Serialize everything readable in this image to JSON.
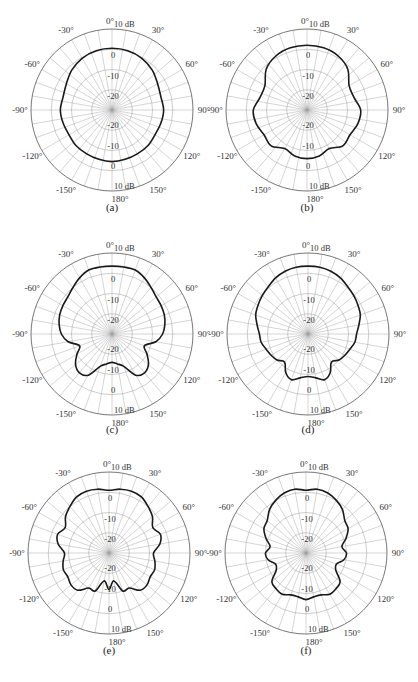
{
  "chart_data": [
    {
      "type": "polar",
      "caption": "(a)",
      "radial_unit": "dB",
      "rlim": [
        -30,
        10
      ],
      "ring_labels_top": [
        "0",
        "-10",
        "-20"
      ],
      "ring_labels_bottom": [
        "-20",
        "-10",
        "0"
      ],
      "outer_label": "10 dB",
      "angle_labels": [
        "0°",
        "30°",
        "60°",
        "90°",
        "120°",
        "150°",
        "180°",
        "-150°",
        "-120°",
        "-90°",
        "-60°",
        "-30°"
      ],
      "theta_deg": [
        0,
        15,
        30,
        45,
        60,
        75,
        90,
        105,
        120,
        135,
        150,
        165,
        180,
        195,
        210,
        225,
        240,
        255,
        270,
        285,
        300,
        315,
        330,
        345
      ],
      "r_db": [
        0.5,
        0.3,
        -0.5,
        -2,
        -4,
        -5,
        -4.5,
        -5,
        -5.5,
        -5,
        -5,
        -4.8,
        -4.5,
        -4.8,
        -5,
        -5,
        -5.5,
        -5,
        -4.5,
        -5,
        -4,
        -2,
        -0.5,
        0.3
      ]
    },
    {
      "type": "polar",
      "caption": "(b)",
      "radial_unit": "dB",
      "rlim": [
        -30,
        10
      ],
      "ring_labels_top": [
        "0",
        "-10",
        "-20"
      ],
      "ring_labels_bottom": [
        "-20",
        "-10",
        "0"
      ],
      "outer_label": "10 dB",
      "angle_labels": [
        "0°",
        "30°",
        "60°",
        "90°",
        "120°",
        "150°",
        "180°",
        "-150°",
        "-120°",
        "-90°",
        "-60°",
        "-30°"
      ],
      "theta_deg": [
        0,
        15,
        30,
        45,
        60,
        75,
        90,
        105,
        120,
        135,
        150,
        165,
        180,
        195,
        210,
        225,
        240,
        255,
        270,
        285,
        300,
        315,
        330,
        345
      ],
      "r_db": [
        2,
        1.8,
        0.8,
        -1.5,
        -6,
        -6,
        -3.5,
        -4,
        -5.5,
        -5,
        -8,
        -6.5,
        -6,
        -6.5,
        -8,
        -5,
        -5.5,
        -4,
        -3.5,
        -6,
        -6,
        -1.5,
        0.8,
        1.8
      ]
    },
    {
      "type": "polar",
      "caption": "(c)",
      "radial_unit": "dB",
      "rlim": [
        -30,
        10
      ],
      "ring_labels_top": [
        "0",
        "-10",
        "-20"
      ],
      "ring_labels_bottom": [
        "-20",
        "-10",
        "0"
      ],
      "outer_label": "10 dB",
      "angle_labels": [
        "0°",
        "30°",
        "60°",
        "90°",
        "120°",
        "150°",
        "180°",
        "-150°",
        "-120°",
        "-90°",
        "-60°",
        "-30°"
      ],
      "theta_deg": [
        0,
        10,
        20,
        30,
        40,
        50,
        60,
        70,
        80,
        90,
        100,
        110,
        120,
        130,
        140,
        150,
        160,
        170,
        180,
        190,
        200,
        210,
        220,
        230,
        240,
        250,
        260,
        270,
        280,
        290,
        300,
        310,
        320,
        330,
        340,
        350
      ],
      "r_db": [
        3.5,
        3.6,
        3.6,
        2,
        0,
        -1.5,
        -2,
        -2.5,
        -3.5,
        -5,
        -8,
        -13,
        -10,
        -6.5,
        -5,
        -6.5,
        -13,
        -15,
        -16,
        -15,
        -13,
        -6.5,
        -5,
        -6.5,
        -10,
        -13,
        -8,
        -5,
        -3.5,
        -2.5,
        -2,
        -1.5,
        0,
        2,
        3.6,
        3.6
      ]
    },
    {
      "type": "polar",
      "caption": "(d)",
      "radial_unit": "dB",
      "rlim": [
        -30,
        10
      ],
      "ring_labels_top": [
        "0",
        "-10",
        "-20"
      ],
      "ring_labels_bottom": [
        "-20",
        "-10",
        "0"
      ],
      "outer_label": "10 dB",
      "angle_labels": [
        "0°",
        "30°",
        "60°",
        "90°",
        "120°",
        "150°",
        "180°",
        "-150°",
        "-120°",
        "-90°",
        "-60°",
        "-30°"
      ],
      "theta_deg": [
        0,
        10,
        20,
        30,
        40,
        50,
        60,
        70,
        80,
        90,
        100,
        110,
        120,
        130,
        140,
        150,
        160,
        170,
        180,
        190,
        200,
        210,
        220,
        230,
        240,
        250,
        260,
        270,
        280,
        290,
        300,
        310,
        320,
        330,
        340,
        350
      ],
      "r_db": [
        3.5,
        3.5,
        3,
        2,
        0.5,
        -0.5,
        -1.5,
        -2.5,
        -4.5,
        -6,
        -6.5,
        -8,
        -9,
        -10,
        -12,
        -8,
        -6,
        -8,
        -9,
        -8,
        -6,
        -8,
        -12,
        -10,
        -9,
        -8,
        -6.5,
        -6,
        -4.5,
        -2.5,
        -1.5,
        -0.5,
        0.5,
        2,
        3,
        3.5
      ]
    },
    {
      "type": "polar",
      "caption": "(e)",
      "radial_unit": "dB",
      "rlim": [
        -30,
        10
      ],
      "ring_labels_top": [
        "0",
        "-10",
        "-20"
      ],
      "ring_labels_bottom": [
        "-20",
        "-10",
        "0"
      ],
      "outer_label": "10 dB",
      "angle_labels": [
        "0°",
        "30°",
        "60°",
        "90°",
        "120°",
        "150°",
        "180°",
        "-150°",
        "-120°",
        "-90°",
        "-60°",
        "-30°"
      ],
      "theta_deg": [
        0,
        10,
        20,
        30,
        40,
        50,
        60,
        70,
        80,
        90,
        100,
        110,
        120,
        130,
        140,
        150,
        160,
        170,
        180,
        190,
        200,
        210,
        220,
        230,
        240,
        250,
        260,
        270,
        280,
        290,
        300,
        310,
        320,
        330,
        340,
        350
      ],
      "r_db": [
        1,
        2,
        2.5,
        2,
        0,
        -2,
        -5,
        -3,
        -4.5,
        -8,
        -7,
        -6,
        -6.5,
        -5.5,
        -6,
        -10,
        -10,
        -16,
        -12,
        -16,
        -10,
        -10,
        -6,
        -5.5,
        -6.5,
        -6,
        -7,
        -8,
        -4.5,
        -3,
        -5,
        -2,
        0,
        2,
        2.5,
        2
      ]
    },
    {
      "type": "polar",
      "caption": "(f)",
      "radial_unit": "dB",
      "rlim": [
        -30,
        10
      ],
      "ring_labels_top": [
        "0",
        "-10",
        "-20"
      ],
      "ring_labels_bottom": [
        "-20",
        "-10",
        "0"
      ],
      "outer_label": "10 dB",
      "angle_labels": [
        "0°",
        "30°",
        "60°",
        "90°",
        "120°",
        "150°",
        "180°",
        "-150°",
        "-120°",
        "-90°",
        "-60°",
        "-30°"
      ],
      "theta_deg": [
        0,
        10,
        20,
        30,
        40,
        50,
        60,
        70,
        80,
        90,
        100,
        110,
        120,
        130,
        140,
        150,
        160,
        170,
        180,
        190,
        200,
        210,
        220,
        230,
        240,
        250,
        260,
        270,
        280,
        290,
        300,
        310,
        320,
        330,
        340,
        350
      ],
      "r_db": [
        1,
        2,
        1.5,
        0,
        -2,
        -5,
        -6,
        -9,
        -12,
        -10,
        -11,
        -14,
        -13,
        -8,
        -7,
        -6.5,
        -8,
        -8,
        -7,
        -8,
        -8,
        -6.5,
        -7,
        -8,
        -13,
        -14,
        -11,
        -10,
        -12,
        -9,
        -6,
        -5,
        -2,
        0,
        1.5,
        2
      ]
    }
  ]
}
